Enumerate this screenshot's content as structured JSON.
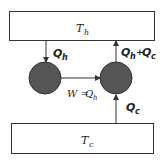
{
  "diagram": {
    "type": "heat-pump-energy-flow",
    "colors": {
      "stroke": "#333333",
      "engine_fill": "#555555",
      "background": "#ffffff"
    },
    "hot_reservoir": {
      "label": "T",
      "subscript": "h"
    },
    "cold_reservoir": {
      "label": "T",
      "subscript": "c"
    },
    "flows": {
      "qh_down": {
        "label": "Q",
        "subscript": "h"
      },
      "work": {
        "prefix": "W =",
        "label": "Q",
        "subscript": "h"
      },
      "qc_up": {
        "label": "Q",
        "subscript": "c"
      },
      "sum_up": {
        "label1": "Q",
        "sub1": "h",
        "plus": "+",
        "label2": "Q",
        "sub2": "c"
      }
    },
    "engines": [
      {
        "name": "left-engine"
      },
      {
        "name": "right-engine"
      }
    ]
  }
}
